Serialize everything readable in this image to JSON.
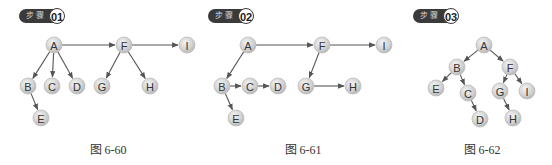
{
  "panels": [
    {
      "step_prefix": "步骤",
      "step_number": "01",
      "caption": "图 6-60",
      "nodes": [
        "A",
        "B",
        "C",
        "D",
        "E",
        "F",
        "G",
        "H",
        "I"
      ],
      "edges": [
        [
          "A",
          "F"
        ],
        [
          "F",
          "I"
        ],
        [
          "A",
          "B"
        ],
        [
          "A",
          "C"
        ],
        [
          "A",
          "D"
        ],
        [
          "B",
          "E"
        ],
        [
          "F",
          "G"
        ],
        [
          "F",
          "H"
        ]
      ]
    },
    {
      "step_prefix": "步骤",
      "step_number": "02",
      "caption": "图 6-61",
      "nodes": [
        "A",
        "B",
        "C",
        "D",
        "E",
        "F",
        "G",
        "H",
        "I"
      ],
      "edges": [
        [
          "A",
          "F"
        ],
        [
          "F",
          "I"
        ],
        [
          "A",
          "B"
        ],
        [
          "B",
          "C"
        ],
        [
          "C",
          "D"
        ],
        [
          "B",
          "E"
        ],
        [
          "F",
          "G"
        ],
        [
          "G",
          "H"
        ]
      ]
    },
    {
      "step_prefix": "步骤",
      "step_number": "03",
      "caption": "图 6-62",
      "nodes": [
        "A",
        "B",
        "C",
        "D",
        "E",
        "F",
        "G",
        "H",
        "I"
      ],
      "edges": [
        [
          "A",
          "B"
        ],
        [
          "A",
          "F"
        ],
        [
          "B",
          "E"
        ],
        [
          "B",
          "C"
        ],
        [
          "C",
          "D"
        ],
        [
          "F",
          "G"
        ],
        [
          "F",
          "I"
        ],
        [
          "G",
          "H"
        ]
      ]
    }
  ]
}
